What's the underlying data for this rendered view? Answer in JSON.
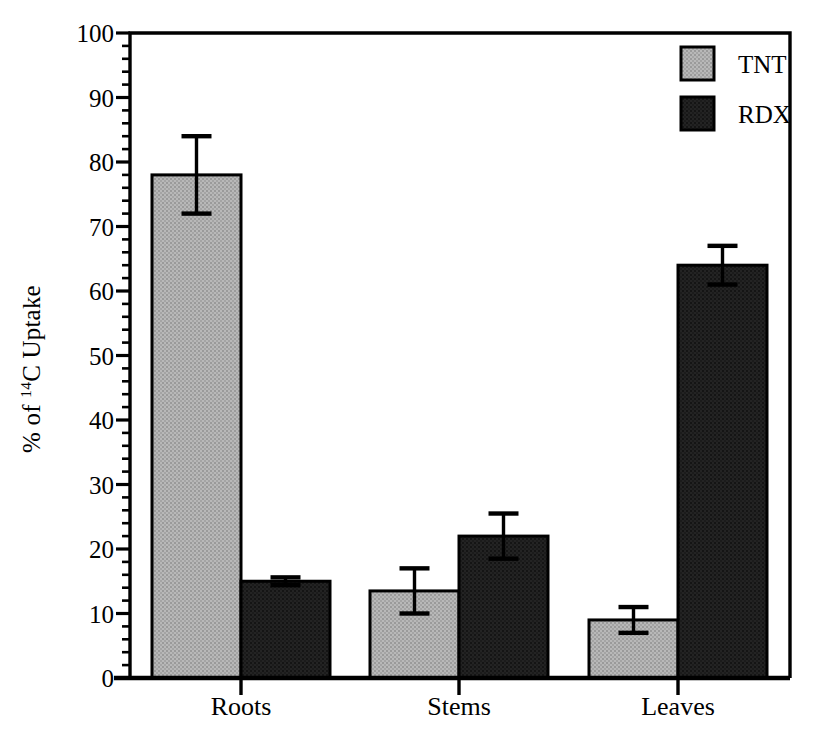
{
  "chart_data": {
    "type": "bar",
    "title": "",
    "xlabel": "",
    "ylabel": "% of 14C Uptake",
    "ylabel_prefix": "% of ",
    "ylabel_sup": "14",
    "ylabel_suffix": "C Uptake",
    "categories": [
      "Roots",
      "Stems",
      "Leaves"
    ],
    "ylim": [
      0,
      100
    ],
    "ytick_major_step": 10,
    "ytick_minor_step": 2,
    "ytick_labels": [
      "0",
      "10",
      "20",
      "30",
      "40",
      "50",
      "60",
      "70",
      "80",
      "90",
      "100"
    ],
    "ytick_values": [
      0,
      10,
      20,
      30,
      40,
      50,
      60,
      70,
      80,
      90,
      100
    ],
    "grid": false,
    "legend_position": "top-right",
    "series": [
      {
        "name": "TNT",
        "color": "#a8a8a8",
        "edge_color": "#000000",
        "values": [
          78,
          13.5,
          9
        ],
        "errors": [
          6,
          3.5,
          2
        ]
      },
      {
        "name": "RDX",
        "color": "#1e1e1e",
        "edge_color": "#000000",
        "values": [
          15,
          22,
          64
        ],
        "errors": [
          0.6,
          3.5,
          3
        ]
      }
    ]
  },
  "axes": {
    "frame_color": "#000000",
    "tick_direction": "out"
  }
}
